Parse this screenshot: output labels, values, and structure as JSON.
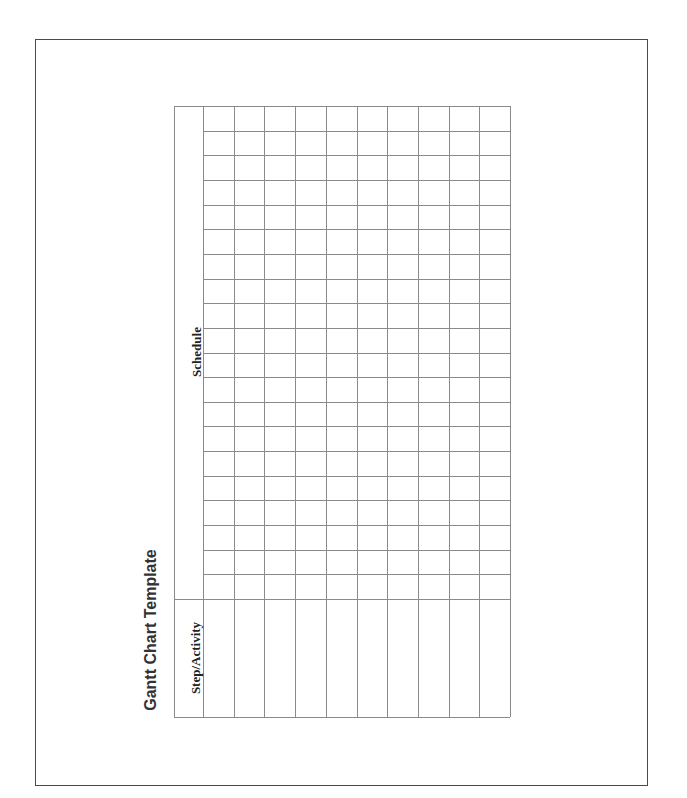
{
  "document": {
    "title": "Gantt Chart Template",
    "table": {
      "schedule_header": "Schedule",
      "activity_header": "Step/Activity",
      "activity_rows": 10,
      "schedule_periods": 20,
      "rows": [
        {
          "activity": "",
          "schedule": []
        },
        {
          "activity": "",
          "schedule": []
        },
        {
          "activity": "",
          "schedule": []
        },
        {
          "activity": "",
          "schedule": []
        },
        {
          "activity": "",
          "schedule": []
        },
        {
          "activity": "",
          "schedule": []
        },
        {
          "activity": "",
          "schedule": []
        },
        {
          "activity": "",
          "schedule": []
        },
        {
          "activity": "",
          "schedule": []
        },
        {
          "activity": "",
          "schedule": []
        }
      ]
    },
    "colors": {
      "grid_line": "#8a8a8a",
      "border": "#4a4a4a",
      "text": "#222222"
    }
  }
}
